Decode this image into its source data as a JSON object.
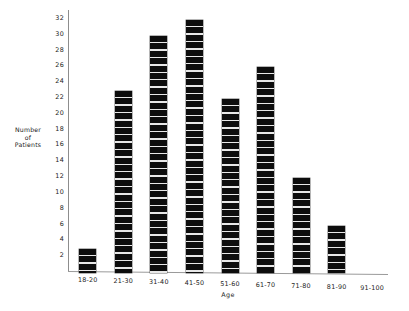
{
  "chart_data": {
    "type": "bar",
    "title": "",
    "subtitle": "",
    "xlabel": "Age",
    "ylabel_lines": [
      "Number",
      "of",
      "Patients"
    ],
    "ylabel": "Number of Patients",
    "categories": [
      "18-20",
      "21-30",
      "31-40",
      "41-50",
      "51-60",
      "61-70",
      "71-80",
      "81-90",
      "91-100"
    ],
    "values": [
      3,
      23,
      30,
      32,
      22,
      26,
      12,
      6,
      0
    ],
    "ylim": [
      0,
      33
    ],
    "yticks": [
      2,
      4,
      6,
      8,
      10,
      12,
      14,
      16,
      18,
      20,
      22,
      24,
      26,
      28,
      30,
      32
    ],
    "ytick_labels": [
      "2",
      "4",
      "6",
      "8",
      "10",
      "12",
      "14",
      "16",
      "18",
      "20",
      "22",
      "24",
      "26",
      "28",
      "30",
      "32"
    ],
    "grid": false,
    "legend": null,
    "legend_position": "none",
    "bar_color": "#0d0d0d",
    "bar_style": "segmented-black",
    "axis_color": "#8d8d8d",
    "background_color": "#ffffff",
    "annotations": []
  }
}
